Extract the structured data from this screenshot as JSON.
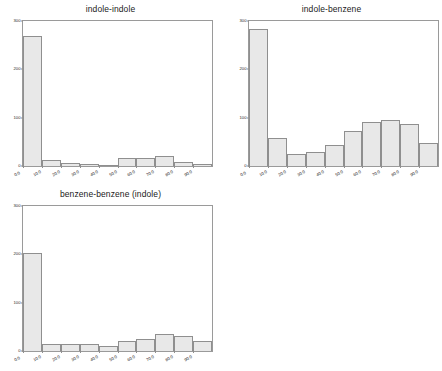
{
  "figure": {
    "background_color": "#ffffff",
    "bar_fill_color": "#e8e8e8",
    "bar_edge_color": "#8f8f8f",
    "axis_color": "#9a9a9a",
    "text_color": "#2b2b2b"
  },
  "chart_data": [
    {
      "type": "bar",
      "title": "indole-indole",
      "xlabel": "",
      "ylabel": "",
      "categories": [
        "0.0",
        "10.0",
        "20.0",
        "30.0",
        "40.0",
        "50.0",
        "60.0",
        "70.0",
        "80.0",
        "90.0"
      ],
      "bin_edges": [
        0,
        10,
        20,
        30,
        40,
        50,
        60,
        70,
        80,
        90
      ],
      "values": [
        268,
        13,
        6,
        5,
        3,
        17,
        17,
        21,
        9,
        4
      ],
      "xlim": [
        0,
        90
      ],
      "ylim": [
        0,
        300
      ],
      "xticks": [
        "0.0",
        "10.0",
        "20.0",
        "30.0",
        "40.0",
        "50.0",
        "60.0",
        "70.0",
        "80.0",
        "90.0"
      ],
      "yticks": [
        "0",
        "100",
        "200",
        "300"
      ],
      "ytick_values": [
        0,
        100,
        200,
        300
      ],
      "grid": false,
      "legend": "none"
    },
    {
      "type": "bar",
      "title": "indole-benzene",
      "xlabel": "",
      "ylabel": "",
      "categories": [
        "0.0",
        "10.0",
        "20.0",
        "30.0",
        "40.0",
        "50.0",
        "60.0",
        "70.0",
        "80.0",
        "90.0"
      ],
      "bin_edges": [
        0,
        10,
        20,
        30,
        40,
        50,
        60,
        70,
        80,
        90
      ],
      "values": [
        284,
        57,
        25,
        29,
        44,
        72,
        92,
        96,
        86,
        47
      ],
      "xlim": [
        0,
        90
      ],
      "ylim": [
        0,
        300
      ],
      "xticks": [
        "0.0",
        "10.0",
        "20.0",
        "30.0",
        "40.0",
        "50.0",
        "60.0",
        "70.0",
        "80.0",
        "90.0"
      ],
      "yticks": [
        "0",
        "100",
        "200",
        "300"
      ],
      "ytick_values": [
        0,
        100,
        200,
        300
      ],
      "grid": false,
      "legend": "none"
    },
    {
      "type": "bar",
      "title": "benzene-benzene (indole)",
      "xlabel": "",
      "ylabel": "",
      "categories": [
        "0.0",
        "10.0",
        "20.0",
        "30.0",
        "40.0",
        "50.0",
        "60.0",
        "70.0",
        "80.0",
        "90.0"
      ],
      "bin_edges": [
        0,
        10,
        20,
        30,
        40,
        50,
        60,
        70,
        80,
        90
      ],
      "values": [
        203,
        14,
        15,
        14,
        11,
        20,
        24,
        36,
        31,
        21
      ],
      "xlim": [
        0,
        90
      ],
      "ylim": [
        0,
        300
      ],
      "xticks": [
        "0.0",
        "10.0",
        "20.0",
        "30.0",
        "40.0",
        "50.0",
        "60.0",
        "70.0",
        "80.0",
        "90.0"
      ],
      "yticks": [
        "0",
        "100",
        "200",
        "300"
      ],
      "ytick_values": [
        0,
        100,
        200,
        300
      ],
      "grid": false,
      "legend": "none"
    }
  ]
}
